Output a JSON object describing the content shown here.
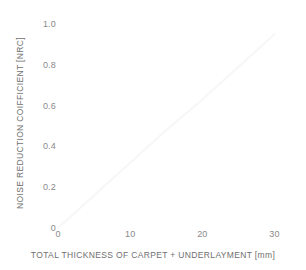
{
  "chart_data": {
    "type": "line",
    "title": "",
    "subtitle": "",
    "xlabel": "TOTAL THICKNESS OF CARPET + UNDERLAYMENT [mm]",
    "ylabel": "NOISE REDUCTION COIFFICIENT [NRC]",
    "xlim": [
      0,
      32
    ],
    "ylim": [
      0,
      1.0
    ],
    "grid": false,
    "legend": false,
    "legend_position": "none",
    "xticks": [
      {
        "value": 0,
        "label": "0"
      },
      {
        "value": 10,
        "label": "10"
      },
      {
        "value": 20,
        "label": "20"
      },
      {
        "value": 30,
        "label": "30"
      }
    ],
    "yticks": [
      {
        "value": 0.0,
        "label": "0"
      },
      {
        "value": 0.2,
        "label": "0.2"
      },
      {
        "value": 0.4,
        "label": "0.4"
      },
      {
        "value": 0.6,
        "label": "0.6"
      },
      {
        "value": 0.8,
        "label": "0.8"
      },
      {
        "value": 1.0,
        "label": "1.0"
      }
    ],
    "series": [
      {
        "name": "NRC trend",
        "color": "#f7f7f7",
        "x": [
          0,
          5,
          10,
          15,
          20,
          25,
          30
        ],
        "values": [
          0.0,
          0.16,
          0.32,
          0.48,
          0.63,
          0.79,
          0.95
        ]
      }
    ],
    "annotations": []
  },
  "style": {
    "background": "#ffffff",
    "tick_label_color": "#8a8a8a",
    "axis_title_color": "#6f6f6f",
    "line_color": "#f7f7f7"
  }
}
